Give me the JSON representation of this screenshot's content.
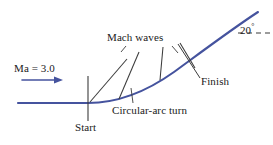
{
  "figure": {
    "colors": {
      "flow_curve": "#45539e",
      "mach_line": "#3b3b3b",
      "text": "#1a1a1a",
      "dashed_reference": "#3b3b3b",
      "background": "#ffffff"
    },
    "labels": {
      "mach_number": "Ma = 3.0",
      "mach_waves": "Mach waves",
      "start": "Start",
      "circular_arc_turn": "Circular-arc turn",
      "finish": "Finish",
      "turn_angle": "20",
      "turn_angle_unit": "°"
    },
    "icons": {
      "flow_arrow": "flow-direction-arrow",
      "dashed_line": "horizontal-reference-dashed-line"
    },
    "geometry": {
      "wall_start_x": 18,
      "wall_y": 103,
      "turn_start_x": 88,
      "turn_end_x": 258,
      "turn_end_y": 12,
      "mach_wave_count": 4,
      "flow_arrow": {
        "x1": 22,
        "y1": 80,
        "x2": 62,
        "y2": 80
      },
      "dashed_reference": {
        "x1": 238,
        "y1": 33,
        "x2": 272,
        "y2": 33
      }
    }
  }
}
